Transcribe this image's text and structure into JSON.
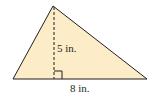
{
  "figure": {
    "shape": "triangle",
    "fill_color": "#fcecc8",
    "stroke_color": "#231f20",
    "vertices": {
      "apex": [
        53,
        6
      ],
      "base_left": [
        13,
        79
      ],
      "base_right": [
        147,
        79
      ]
    },
    "height_line": {
      "style": "dashed",
      "x": 54,
      "y_top": 6,
      "y_bottom": 79
    },
    "right_angle_marker": true,
    "height_label": "5 in.",
    "base_label": "8 in."
  }
}
